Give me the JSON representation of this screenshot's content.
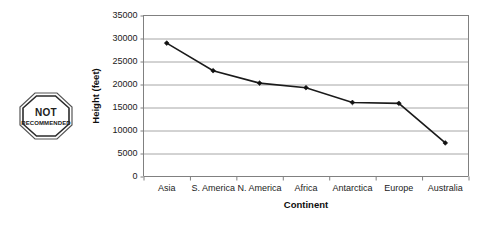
{
  "stamp": {
    "name": "not-recommended-stamp",
    "line1": "NOT",
    "line2": "RECOMMENDED"
  },
  "chart_data": {
    "type": "line",
    "title": "",
    "xlabel": "Continent",
    "ylabel": "Height (feet)",
    "categories": [
      "Asia",
      "S. America",
      "N. America",
      "Africa",
      "Antarctica",
      "Europe",
      "Australia"
    ],
    "values": [
      29000,
      23000,
      20300,
      19300,
      16100,
      15900,
      7300
    ],
    "ylim": [
      0,
      35000
    ],
    "yticks": [
      0,
      5000,
      10000,
      15000,
      20000,
      25000,
      30000,
      35000
    ],
    "ytick_labels": [
      "0",
      "5000",
      "10000",
      "15000",
      "20000",
      "25000",
      "30000",
      "35000"
    ],
    "grid": true,
    "grid_axis": "y",
    "legend": false,
    "marker": "diamond",
    "line_color": "#1a1a1a",
    "marker_color": "#111111",
    "grid_color": "#a6a6a6",
    "axis_color": "#808080"
  }
}
